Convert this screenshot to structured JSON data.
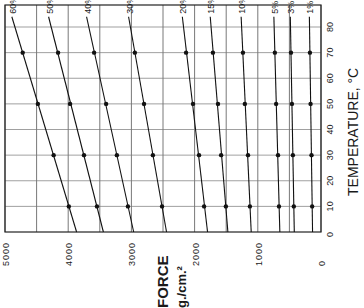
{
  "chart_data": {
    "type": "line",
    "title": "",
    "orientation": "rotated 90deg counter-clockwise (force axis runs along bottom edge, temperature along right edge)",
    "xlabel": "TEMPERATURE, °C",
    "ylabel": "FORCE g./cm.²",
    "ylabel_line1": "FORCE",
    "ylabel_line2": "g./cm.²",
    "x": [
      10,
      30,
      50,
      70
    ],
    "xlim": [
      0,
      85
    ],
    "ylim": [
      0,
      5000
    ],
    "x_ticks": [
      0,
      10,
      20,
      30,
      40,
      50,
      60,
      70,
      80
    ],
    "y_ticks": [
      0,
      1000,
      2000,
      3000,
      4000,
      5000
    ],
    "y_tick_labels": [
      "0",
      "1000",
      "2000",
      "3000",
      "4000",
      "5000"
    ],
    "grid": true,
    "grid_minor_force_step": 500,
    "legend": "inline labels at top end of each line",
    "series": [
      {
        "name": "60%",
        "values": [
          3990,
          4230,
          4480,
          4720
        ]
      },
      {
        "name": "50%",
        "values": [
          3545,
          3750,
          3970,
          4160
        ]
      },
      {
        "name": "40%",
        "values": [
          3055,
          3230,
          3400,
          3590
        ]
      },
      {
        "name": "30%",
        "values": [
          2515,
          2660,
          2800,
          2945
        ]
      },
      {
        "name": "20%",
        "values": [
          1850,
          1930,
          2025,
          2135
        ]
      },
      {
        "name": "15%",
        "values": [
          1505,
          1580,
          1630,
          1710
        ]
      },
      {
        "name": "10%",
        "values": [
          1125,
          1155,
          1205,
          1235
        ]
      },
      {
        "name": "5%",
        "values": [
          665,
          680,
          710,
          730
        ]
      },
      {
        "name": "3%",
        "values": [
          430,
          445,
          460,
          475
        ]
      },
      {
        "name": "1%",
        "values": [
          140,
          150,
          165,
          175
        ]
      }
    ]
  }
}
